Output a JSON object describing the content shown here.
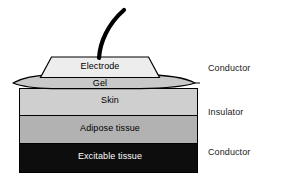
{
  "figure": {
    "background_color": "#ffffff"
  },
  "stack": {
    "layers": [
      {
        "key": "electrode",
        "label": "Electrode",
        "shape": "trapezoid",
        "fill": "#ededed",
        "stroke": "#000000",
        "text_color": "#000000"
      },
      {
        "key": "gel",
        "label": "Gel",
        "shape": "lens-ellipse",
        "fill": "#c9c9c9",
        "stroke": "#000000",
        "text_color": "#000000"
      },
      {
        "key": "skin",
        "label": "Skin",
        "shape": "rect",
        "fill": "#cfcfcf",
        "stroke": "#000000",
        "text_color": "#000000"
      },
      {
        "key": "adipose",
        "label": "Adipose tissue",
        "shape": "rect",
        "fill": "#b2b2b2",
        "stroke": "#000000",
        "text_color": "#000000"
      },
      {
        "key": "excitable",
        "label": "Excitable tissue",
        "shape": "rect",
        "fill": "#0d0d0d",
        "stroke": "#000000",
        "text_color": "#ffffff"
      }
    ]
  },
  "lead": {
    "name": "Lead wire",
    "color": "#000000"
  },
  "side_labels": [
    {
      "key": "conductor_top",
      "label": "Conductor",
      "applies_to": "Electrode + Gel"
    },
    {
      "key": "insulator",
      "label": "Insulator",
      "applies_to": "Skin + Adipose tissue"
    },
    {
      "key": "conductor_bottom",
      "label": "Conductor",
      "applies_to": "Excitable tissue"
    }
  ],
  "colors": {
    "electrode": "#ededed",
    "gel": "#c9c9c9",
    "skin": "#cfcfcf",
    "adipose": "#b2b2b2",
    "excitable": "#0d0d0d",
    "outline": "#000000",
    "text": "#000000",
    "text_on_dark": "#ffffff"
  }
}
